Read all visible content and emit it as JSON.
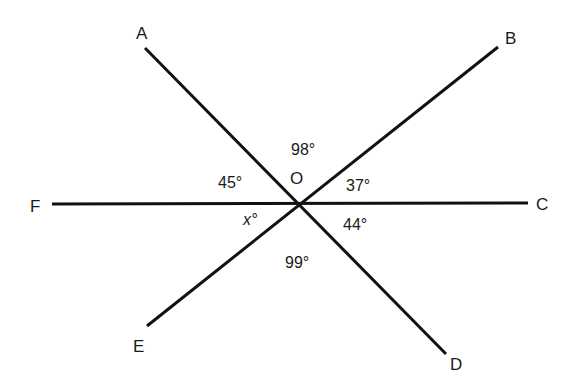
{
  "diagram": {
    "center": {
      "label": "O",
      "x": 298,
      "y": 205
    },
    "points": [
      {
        "label": "A",
        "x": 145,
        "y": 48,
        "label_x": 142,
        "label_y": 40
      },
      {
        "label": "B",
        "x": 498,
        "y": 47,
        "label_x": 512,
        "label_y": 44
      },
      {
        "label": "C",
        "x": 528,
        "y": 203,
        "label_x": 544,
        "label_y": 210
      },
      {
        "label": "D",
        "x": 446,
        "y": 354,
        "label_x": 456,
        "label_y": 369
      },
      {
        "label": "E",
        "x": 147,
        "y": 326,
        "label_x": 139,
        "label_y": 352
      },
      {
        "label": "F",
        "x": 52,
        "y": 204,
        "label_x": 36,
        "label_y": 211
      }
    ],
    "lines": [
      {
        "name": "line-AD",
        "from": "A",
        "to": "D"
      },
      {
        "name": "line-BE",
        "from": "B",
        "to": "E"
      },
      {
        "name": "line-FC",
        "from": "F",
        "to": "C"
      }
    ],
    "angles": [
      {
        "name": "angle-AOB",
        "value": "98°",
        "x": 291,
        "y": 155
      },
      {
        "name": "angle-FOA",
        "value": "45°",
        "x": 218,
        "y": 188
      },
      {
        "name": "angle-BOC",
        "value": "37°",
        "x": 346,
        "y": 191
      },
      {
        "name": "angle-COD",
        "value": "44°",
        "x": 343,
        "y": 230
      },
      {
        "name": "angle-DOE",
        "value": "99°",
        "x": 285,
        "y": 268
      },
      {
        "name": "angle-EOF",
        "value": "x°",
        "x": 243,
        "y": 225,
        "italic": true
      }
    ]
  }
}
